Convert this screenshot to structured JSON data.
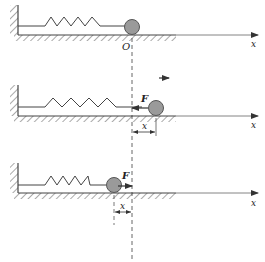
{
  "diagram": {
    "colors": {
      "line": "#444444",
      "ball_fill": "#9a9a9a",
      "ball_stroke": "#555555",
      "dashed": "#555555"
    },
    "equilibrium_x": 132,
    "panels": [
      {
        "name": "equilibrium",
        "ground_y": 35,
        "ball_cx": 132,
        "origin_label": "O",
        "axis_label": "x"
      },
      {
        "name": "stretched",
        "ground_y": 116,
        "ball_cx": 156,
        "force_label": "F",
        "force_direction": "left",
        "displacement_label": "x",
        "axis_label": "x",
        "velocity_arrow": "right"
      },
      {
        "name": "compressed",
        "ground_y": 193,
        "ball_cx": 114,
        "force_label": "F",
        "force_direction": "right",
        "displacement_label": "x",
        "axis_label": "x"
      }
    ]
  }
}
